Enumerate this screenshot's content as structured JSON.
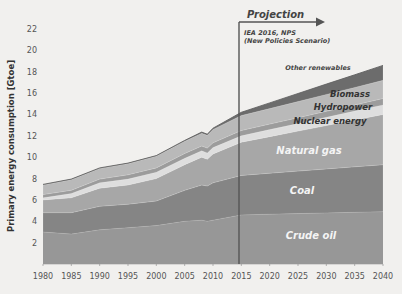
{
  "chart_data": {
    "type": "area",
    "stacked": true,
    "title": "",
    "xlabel": "",
    "ylabel": "Primary energy consumption [Gtoe]",
    "xlim": [
      1980,
      2040
    ],
    "ylim": [
      0,
      23
    ],
    "x_ticks": [
      1980,
      1985,
      1990,
      1995,
      2000,
      2005,
      2010,
      2015,
      2020,
      2025,
      2030,
      2035,
      2040
    ],
    "y_ticks": [
      2,
      4,
      6,
      8,
      10,
      12,
      14,
      16,
      18,
      20,
      22
    ],
    "grid": false,
    "x": [
      1980,
      1985,
      1990,
      1995,
      2000,
      2005,
      2008,
      2009,
      2010,
      2015,
      2020,
      2025,
      2030,
      2035,
      2040
    ],
    "series": [
      {
        "name": "Crude oil",
        "color": "#979797",
        "label_color": "#f4f4f4",
        "values": [
          3.0,
          2.8,
          3.2,
          3.4,
          3.6,
          4.0,
          4.1,
          4.0,
          4.1,
          4.6,
          4.66,
          4.72,
          4.78,
          4.84,
          4.9
        ]
      },
      {
        "name": "Coal",
        "color": "#858585",
        "label_color": "#f4f4f4",
        "values": [
          1.8,
          2.0,
          2.2,
          2.2,
          2.3,
          2.9,
          3.3,
          3.3,
          3.5,
          3.7,
          3.84,
          3.98,
          4.12,
          4.26,
          4.4
        ]
      },
      {
        "name": "Natural gas",
        "color": "#a7a7a7",
        "label_color": "#f4f4f4",
        "values": [
          1.2,
          1.4,
          1.7,
          1.8,
          2.1,
          2.4,
          2.6,
          2.5,
          2.7,
          3.1,
          3.42,
          3.74,
          4.06,
          4.38,
          4.7
        ]
      },
      {
        "name": "Nuclear energy",
        "color": "#dedede",
        "label_color": "#333333",
        "values": [
          0.2,
          0.4,
          0.5,
          0.55,
          0.6,
          0.6,
          0.6,
          0.6,
          0.6,
          0.6,
          0.66,
          0.72,
          0.78,
          0.84,
          0.9
        ]
      },
      {
        "name": "Hydropower",
        "color": "#9c9c9c",
        "label_color": "#333333",
        "values": [
          0.3,
          0.3,
          0.35,
          0.4,
          0.4,
          0.45,
          0.45,
          0.45,
          0.45,
          0.5,
          0.52,
          0.54,
          0.56,
          0.58,
          0.6
        ]
      },
      {
        "name": "Biomass",
        "color": "#b9b9b9",
        "label_color": "#333333",
        "values": [
          0.9,
          1.0,
          1.0,
          1.05,
          1.1,
          1.15,
          1.2,
          1.2,
          1.25,
          1.4,
          1.46,
          1.52,
          1.58,
          1.64,
          1.7
        ]
      },
      {
        "name": "Other renewables",
        "color": "#6c6c6c",
        "label_color": "#444444",
        "values": [
          0.05,
          0.05,
          0.05,
          0.05,
          0.05,
          0.07,
          0.1,
          0.1,
          0.12,
          0.3,
          0.52,
          0.74,
          0.96,
          1.18,
          1.4
        ]
      }
    ],
    "annotations": [
      {
        "text": "Projection",
        "x": 2015,
        "type": "vertical-line-with-arrow"
      },
      {
        "text": "IEA 2016, NPS",
        "x": 2015
      },
      {
        "text": "(New Policies Scenario)",
        "x": 2015
      }
    ]
  },
  "labels": {
    "ylabel": "Primary energy consumption [Gtoe]",
    "projection": "Projection",
    "source_line1": "IEA 2016, NPS",
    "source_line2": "(New Policies Scenario)"
  },
  "series_label_positions": [
    {
      "name": "Crude oil",
      "x": 311,
      "y": 239,
      "size": 10,
      "weight": "bold"
    },
    {
      "name": "Coal",
      "x": 302,
      "y": 194,
      "size": 10,
      "weight": "bold"
    },
    {
      "name": "Natural gas",
      "x": 309,
      "y": 154,
      "size": 10,
      "weight": "bold"
    },
    {
      "name": "Nuclear energy",
      "x": 330,
      "y": 124,
      "size": 8.5,
      "weight": "bold"
    },
    {
      "name": "Hydropower",
      "x": 343,
      "y": 110,
      "size": 8.5,
      "weight": "bold"
    },
    {
      "name": "Biomass",
      "x": 350,
      "y": 97,
      "size": 8.5,
      "weight": "bold"
    },
    {
      "name": "Other renewables",
      "x": 318,
      "y": 70,
      "size": 6.5,
      "weight": "bold"
    }
  ],
  "colors": {
    "background": "#f1f0ee",
    "projection_line": "#555555",
    "axis_text": "#555555"
  }
}
